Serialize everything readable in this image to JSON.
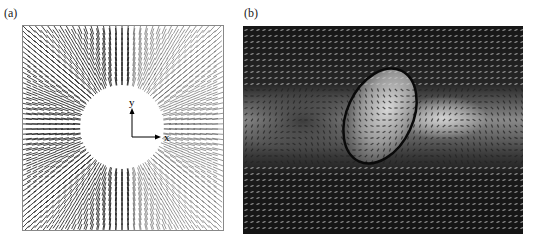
{
  "figure": {
    "panels": [
      {
        "label": "(a)",
        "description": "Radial vector field around a circular hole",
        "axes": {
          "x_label": "x",
          "y_label": "y"
        }
      },
      {
        "label": "(b)",
        "description": "Grayscale vector field with elliptical inclusion",
        "ellipse": {
          "cx": 137,
          "cy": 90,
          "rx": 33,
          "ry": 50,
          "rotation_deg": 25
        }
      }
    ]
  },
  "colors": {
    "arrow_dark": "#111111",
    "panel_b_bg": "#1a1a1a",
    "panel_b_band": "#bdbdbd"
  }
}
